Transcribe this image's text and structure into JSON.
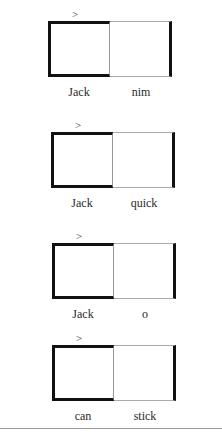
{
  "diagram": {
    "pointer_symbol": ">",
    "groups": [
      {
        "left_label": "Jack",
        "right_label": "nim"
      },
      {
        "left_label": "Jack",
        "right_label": "quick"
      },
      {
        "left_label": "Jack",
        "right_label": "o"
      },
      {
        "left_label": "can",
        "right_label": "stick"
      }
    ]
  },
  "colors": {
    "thick_border": "#111111",
    "thin_border": "#aaaaaa",
    "text": "#2a2a2a",
    "separator": "#9a9a9a"
  }
}
